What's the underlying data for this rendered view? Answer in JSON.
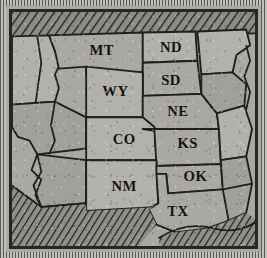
{
  "figure": {
    "kind": "printed-map-plate",
    "region": "Great Plains and Mountain West, United States",
    "frame_style": "stippled paper border with heavy ink plate rule",
    "colors": {
      "paper": "#a9a8a3",
      "ink": "#201f1c",
      "frame": "#4a4a46",
      "state_light": "#b2b1ab",
      "state_dim": "#a1a09a"
    }
  },
  "labels": [
    {
      "code": "MT",
      "name": "montana",
      "x": 92,
      "y": 41
    },
    {
      "code": "ND",
      "name": "north-dakota",
      "x": 163,
      "y": 38
    },
    {
      "code": "SD",
      "name": "south-dakota",
      "x": 163,
      "y": 71
    },
    {
      "code": "WY",
      "name": "wyoming",
      "x": 106,
      "y": 83
    },
    {
      "code": "NE",
      "name": "nebraska",
      "x": 170,
      "y": 103
    },
    {
      "code": "CO",
      "name": "colorado",
      "x": 115,
      "y": 132
    },
    {
      "code": "KS",
      "name": "kansas",
      "x": 180,
      "y": 135
    },
    {
      "code": "NM",
      "name": "new-mexico",
      "x": 115,
      "y": 180
    },
    {
      "code": "OK",
      "name": "oklahoma",
      "x": 188,
      "y": 169
    },
    {
      "code": "TX",
      "name": "texas",
      "x": 170,
      "y": 205
    }
  ],
  "hatched_areas": [
    {
      "name": "canada-border-band",
      "position": "top edge"
    },
    {
      "name": "mexico-area",
      "position": "bottom left"
    },
    {
      "name": "gulf-of-mexico-area",
      "position": "bottom right"
    }
  ],
  "unlabeled_states": [
    "washington-oregon-idaho-strip",
    "nevada-utah",
    "arizona",
    "minnesota",
    "iowa",
    "missouri",
    "arkansas",
    "louisiana"
  ]
}
